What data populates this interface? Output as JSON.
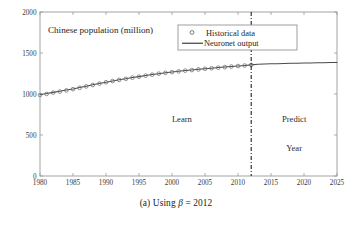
{
  "figure": {
    "caption_prefix": "(a) Using",
    "caption_symbol": "β",
    "caption_equals": "=",
    "caption_value": "2012"
  },
  "chart_data": {
    "type": "line",
    "title": "Chinese population (million)",
    "xlabel": "Year",
    "ylabel": "",
    "xlim": [
      1980,
      2025
    ],
    "ylim": [
      0,
      2000
    ],
    "xticks": [
      1980,
      1985,
      1990,
      1995,
      2000,
      2005,
      2010,
      2015,
      2020,
      2025
    ],
    "yticks": [
      0,
      500,
      1000,
      1500,
      2000
    ],
    "grid": false,
    "legend_position": "top-center",
    "legend": [
      "Historical data",
      "Neuronet output"
    ],
    "annotations": [
      {
        "text": "Learn",
        "x": 2001.5,
        "y": 660
      },
      {
        "text": "Predict",
        "x": 2018.5,
        "y": 660
      },
      {
        "text": "Year",
        "x": 2018.5,
        "y": 300
      }
    ],
    "divider": {
      "x": 2012,
      "style": "dash-dot",
      "label": "beta"
    },
    "series": [
      {
        "name": "Historical data",
        "marker": "circle",
        "x": [
          1980,
          1981,
          1982,
          1983,
          1984,
          1985,
          1986,
          1987,
          1988,
          1989,
          1990,
          1991,
          1992,
          1993,
          1994,
          1995,
          1996,
          1997,
          1998,
          1999,
          2000,
          2001,
          2002,
          2003,
          2004,
          2005,
          2006,
          2007,
          2008,
          2009,
          2010,
          2011,
          2012
        ],
        "values": [
          987,
          1001,
          1017,
          1030,
          1044,
          1059,
          1075,
          1093,
          1110,
          1127,
          1143,
          1158,
          1172,
          1185,
          1199,
          1211,
          1224,
          1236,
          1248,
          1258,
          1267,
          1276,
          1285,
          1292,
          1300,
          1308,
          1314,
          1321,
          1328,
          1335,
          1341,
          1347,
          1354
        ]
      },
      {
        "name": "Neuronet output",
        "marker": "none",
        "x": [
          1980,
          1981,
          1982,
          1983,
          1984,
          1985,
          1986,
          1987,
          1988,
          1989,
          1990,
          1991,
          1992,
          1993,
          1994,
          1995,
          1996,
          1997,
          1998,
          1999,
          2000,
          2001,
          2002,
          2003,
          2004,
          2005,
          2006,
          2007,
          2008,
          2009,
          2010,
          2011,
          2012,
          2013,
          2014,
          2015,
          2016,
          2017,
          2018,
          2019,
          2020,
          2021,
          2022,
          2023,
          2024,
          2025
        ],
        "values": [
          992,
          1006,
          1020,
          1034,
          1048,
          1062,
          1078,
          1095,
          1112,
          1128,
          1144,
          1159,
          1173,
          1187,
          1200,
          1212,
          1225,
          1237,
          1248,
          1258,
          1268,
          1277,
          1286,
          1293,
          1301,
          1308,
          1315,
          1322,
          1329,
          1336,
          1342,
          1348,
          1355,
          1362,
          1365,
          1368,
          1370,
          1372,
          1374,
          1376,
          1377,
          1379,
          1380,
          1382,
          1383,
          1385
        ]
      }
    ]
  },
  "plot_box": {
    "left": 40,
    "right": 337,
    "top": 12,
    "bottom": 176
  },
  "legend_box": {
    "left": 178,
    "right": 297,
    "top": 25,
    "bottom": 50
  },
  "title_position": {
    "x": 48,
    "y": 33
  },
  "colors": {
    "axis": "#9a9a9a",
    "line": "#4a4a4a",
    "marker": "#6d6d6d",
    "divider": "#2b2b2b",
    "text": "#242424",
    "background": "#ffffff"
  }
}
